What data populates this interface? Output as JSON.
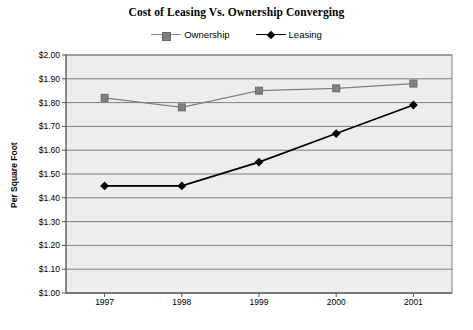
{
  "chart_data": {
    "type": "line",
    "title": "Cost of Leasing Vs. Ownership Converging",
    "xlabel": "",
    "ylabel": "Per Square Foot",
    "categories": [
      "1997",
      "1998",
      "1999",
      "2000",
      "2001"
    ],
    "series": [
      {
        "name": "Ownership",
        "marker": "square",
        "color": "#808080",
        "values": [
          1.82,
          1.78,
          1.85,
          1.86,
          1.88
        ]
      },
      {
        "name": "Leasing",
        "marker": "diamond",
        "color": "#000000",
        "values": [
          1.45,
          1.45,
          1.55,
          1.67,
          1.79
        ]
      }
    ],
    "ylim": [
      1.0,
      2.0
    ],
    "ytick_step": 0.1,
    "ytick_labels": [
      "$2.00",
      "$1.90",
      "$1.80",
      "$1.70",
      "$1.60",
      "$1.50",
      "$1.40",
      "$1.30",
      "$1.20",
      "$1.10",
      "$1.00"
    ],
    "ytick_values": [
      2.0,
      1.9,
      1.8,
      1.7,
      1.6,
      1.5,
      1.4,
      1.3,
      1.2,
      1.1,
      1.0
    ],
    "grid": true,
    "grid_axis": "y",
    "legend_position": "top",
    "plot_background": "#ededed",
    "border_color": "#808080",
    "gridline_color": "#7f7f7f"
  }
}
